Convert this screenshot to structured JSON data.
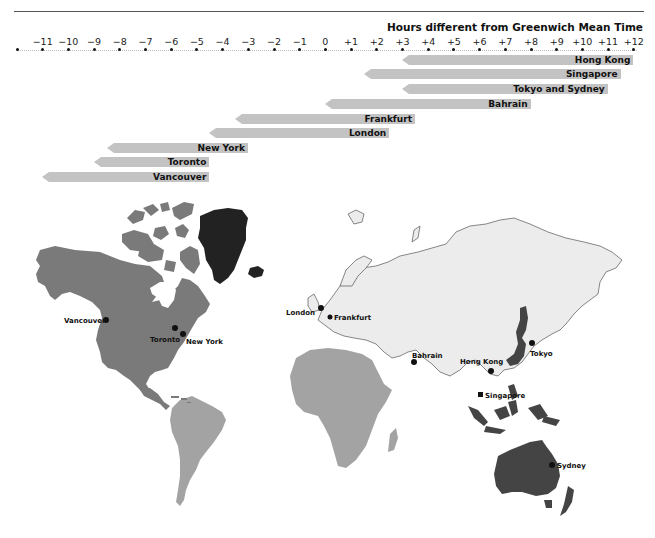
{
  "header": {
    "title": "Hours different from Greenwich Mean Time"
  },
  "axis": {
    "ticks": [
      "",
      "−11",
      "−10",
      "−9",
      "−8",
      "−7",
      "−6",
      "−5",
      "−4",
      "−3",
      "−2",
      "−1",
      "0",
      "+1",
      "+2",
      "+3",
      "+4",
      "+5",
      "+6",
      "+7",
      "+8",
      "+9",
      "+10",
      "+11",
      "+12"
    ]
  },
  "bars": [
    {
      "city": "Hong Kong",
      "offset": "+8"
    },
    {
      "city": "Singapore",
      "offset": "+8"
    },
    {
      "city": "Tokyo and Sydney",
      "offset": "+9"
    },
    {
      "city": "Bahrain",
      "offset": "+3"
    },
    {
      "city": "Frankfurt",
      "offset": "+1"
    },
    {
      "city": "London",
      "offset": "0"
    },
    {
      "city": "New York",
      "offset": "−5"
    },
    {
      "city": "Toronto",
      "offset": "−5"
    },
    {
      "city": "Vancouver",
      "offset": "−8"
    }
  ],
  "map": {
    "cities": {
      "vancouver": "Vancouver",
      "toronto": "Toronto",
      "new_york": "New York",
      "london": "London",
      "frankfurt": "Frankfurt",
      "bahrain": "Bahrain",
      "hong_kong": "Hong Kong",
      "singapore": "Singapore",
      "tokyo": "Tokyo",
      "sydney": "Sydney"
    },
    "colors": {
      "north_america": "#7a7a7a",
      "greenland": "#222222",
      "south_america_africa": "#a3a3a3",
      "eurasia": "#ececec",
      "asia_pacific": "#444444",
      "bar": "#c3c3c3"
    }
  },
  "chart_data": {
    "type": "bar",
    "title": "Hours different from Greenwich Mean Time",
    "xlabel": "Hours different from Greenwich Mean Time",
    "ylabel": "",
    "xlim": [
      -12,
      12
    ],
    "x_ticks": [
      -11,
      -10,
      -9,
      -8,
      -7,
      -6,
      -5,
      -4,
      -3,
      -2,
      -1,
      0,
      1,
      2,
      3,
      4,
      5,
      6,
      7,
      8,
      9,
      10,
      11,
      12
    ],
    "categories": [
      "Hong Kong",
      "Singapore",
      "Tokyo and Sydney",
      "Bahrain",
      "Frankfurt",
      "London",
      "New York",
      "Toronto",
      "Vancouver"
    ],
    "bar_start_hours": [
      3,
      1.5,
      3,
      0,
      -3.5,
      -4.5,
      -8.5,
      -9,
      -11
    ],
    "bar_end_hours": [
      12,
      11.5,
      11,
      8,
      3.5,
      2.5,
      -3,
      -4.5,
      -4.5
    ],
    "legend": [],
    "grid": false
  }
}
